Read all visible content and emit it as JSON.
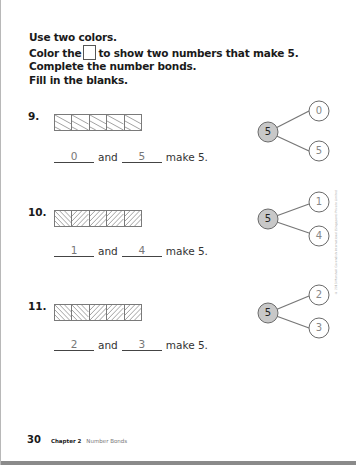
{
  "instructions": {
    "line1": "Use two colors.",
    "line2_before": "Color the",
    "line2_after": "to show two numbers that make 5.",
    "line3": "Complete the number bonds.",
    "line4": "Fill in the blanks."
  },
  "problems": [
    {
      "number": "9.",
      "cells": [
        "back",
        "back",
        "back",
        "back",
        "back"
      ],
      "answer": {
        "first": "0",
        "and": "and",
        "second": "5",
        "suffix": "make 5."
      },
      "bond": {
        "whole": "5",
        "part_top": "0",
        "part_bottom": "5"
      }
    },
    {
      "number": "10.",
      "cells": [
        "back",
        "forward",
        "forward",
        "forward",
        "forward"
      ],
      "answer": {
        "first": "1",
        "and": "and",
        "second": "4",
        "suffix": "make 5."
      },
      "bond": {
        "whole": "5",
        "part_top": "1",
        "part_bottom": "4"
      }
    },
    {
      "number": "11.",
      "cells": [
        "back",
        "back",
        "forward",
        "forward",
        "forward"
      ],
      "answer": {
        "first": "2",
        "and": "and",
        "second": "3",
        "suffix": "make 5."
      },
      "bond": {
        "whole": "5",
        "part_top": "2",
        "part_bottom": "3"
      }
    }
  ],
  "copyright": "© 2013 Marshall Cavendish International (Singapore) Private Limited",
  "footer": {
    "page_number": "30",
    "chapter": "Chapter 2",
    "chapter_title": "Number Bonds"
  },
  "colors": {
    "whole_circle_fill": "#c8c8c8",
    "outline": "#6a6a6a",
    "answer_text": "#777777"
  }
}
